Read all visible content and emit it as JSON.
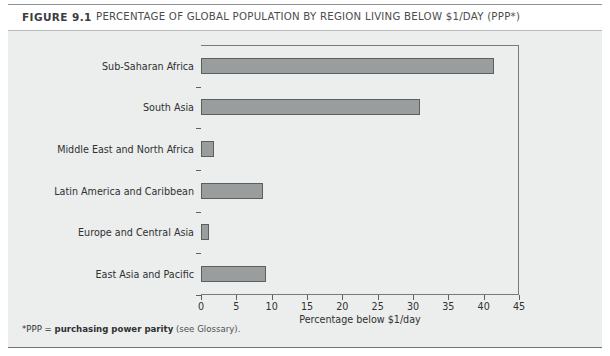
{
  "figure": {
    "number_label": "FIGURE 9.1",
    "title": "PERCENTAGE OF GLOBAL POPULATION BY REGION LIVING BELOW $1/DAY (PPP*)",
    "footnote_prefix": "*PPP = ",
    "footnote_bold": "purchasing power parity",
    "footnote_suffix": " (see Glossary)."
  },
  "chart_data": {
    "type": "bar",
    "orientation": "horizontal",
    "title": "PERCENTAGE OF GLOBAL POPULATION BY REGION LIVING BELOW $1/DAY (PPP*)",
    "categories": [
      "Sub-Saharan Africa",
      "South Asia",
      "Middle East and North Africa",
      "Latin America and Caribbean",
      "Europe and Central Asia",
      "East Asia and Pacific"
    ],
    "values": [
      41.5,
      31.0,
      1.8,
      8.8,
      1.2,
      9.2
    ],
    "xlabel": "Percentage below $1/day",
    "ylabel": "",
    "xlim": [
      0,
      45
    ],
    "xticks": [
      0,
      5,
      10,
      15,
      20,
      25,
      30,
      35,
      40,
      45
    ],
    "xticklabels": [
      "0",
      "5",
      "10",
      "15",
      "20",
      "25",
      "30",
      "35",
      "40",
      "45"
    ],
    "grid": false,
    "legend": null,
    "bar_color": "#9a9d9e",
    "bar_edge_color": "#5c5f60",
    "plot_background": "#eceded"
  }
}
